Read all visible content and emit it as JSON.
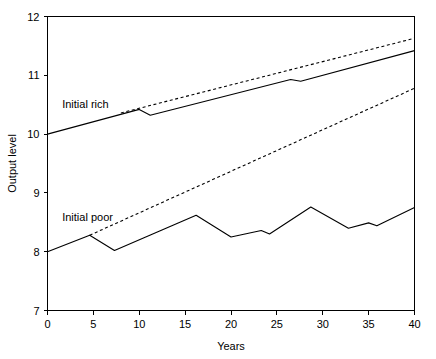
{
  "chart_data": {
    "type": "line",
    "title": "",
    "xlabel": "Years",
    "ylabel": "Output level",
    "xlim": [
      0,
      40
    ],
    "ylim": [
      7,
      12
    ],
    "grid": false,
    "legend": "inline-annotations",
    "xticks": [
      0,
      5,
      10,
      15,
      20,
      25,
      30,
      35,
      40
    ],
    "xtick_labels": [
      "0",
      "5",
      "10",
      "15",
      "20",
      "25",
      "30",
      "35",
      "40"
    ],
    "yticks": [
      7,
      8,
      9,
      10,
      11,
      12
    ],
    "ytick_labels": [
      "7",
      "8",
      "9",
      "10",
      "11",
      "12"
    ],
    "annotations": [
      {
        "text": "Initial rich",
        "x": 1.6,
        "y": 10.45
      },
      {
        "text": "Initial poor",
        "x": 1.6,
        "y": 8.52
      }
    ],
    "series": [
      {
        "name": "Initial rich actual",
        "style": "solid",
        "x": [
          0,
          10.0,
          11.2,
          26.5,
          27.6,
          40
        ],
        "values": [
          10.0,
          10.42,
          10.32,
          10.93,
          10.9,
          11.42
        ]
      },
      {
        "name": "Initial rich trend",
        "style": "dashed",
        "x": [
          8.0,
          40
        ],
        "values": [
          10.36,
          11.63
        ]
      },
      {
        "name": "Initial poor actual",
        "style": "solid",
        "x": [
          0,
          4.6,
          7.3,
          16.2,
          20.0,
          23.3,
          24.2,
          28.7,
          32.8,
          35.0,
          35.9,
          40
        ],
        "values": [
          8.0,
          8.28,
          8.02,
          8.62,
          8.25,
          8.36,
          8.3,
          8.76,
          8.4,
          8.49,
          8.44,
          8.75
        ]
      },
      {
        "name": "Initial poor trend",
        "style": "dashed",
        "x": [
          4.6,
          40
        ],
        "values": [
          8.28,
          10.78
        ]
      }
    ]
  }
}
